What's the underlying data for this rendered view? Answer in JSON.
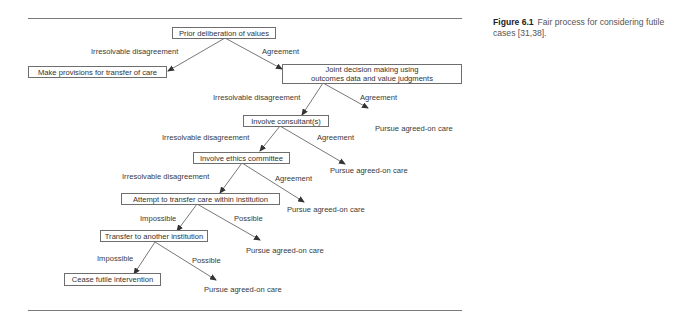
{
  "caption": {
    "figure_label": "Figure 6.1",
    "text": "Fair process for considering futile cases [31,38]."
  },
  "nodes": {
    "prior": "Prior deliberation of values",
    "provisions": "Make provisions for transfer of care",
    "joint": "Joint decision making using outcomes data and value judgments",
    "consultant": "Involve consultant(s)",
    "ethics": "Involve ethics committee",
    "attempt": "Attempt to transfer care within institution",
    "transfer": "Transfer to another institution",
    "cease": "Cease futile intervention",
    "pursue1": "Pursue agreed-on care",
    "pursue2": "Pursue agreed-on care",
    "pursue3": "Pursue agreed-on care",
    "pursue4": "Pursue agreed-on care",
    "pursue5": "Pursue agreed-on care"
  },
  "edge_labels": {
    "e1_disagree": "Irresolvable disagreement",
    "e1_agree": "Agreement",
    "e2_disagree": "Irresolvable disagreement",
    "e2_agree": "Agreement",
    "e3_disagree": "Irresolvable disagreement",
    "e3_agree": "Agreement",
    "e4_disagree": "Irresolvable disagreement",
    "e4_agree": "Agreement",
    "e5_impossible": "Impossible",
    "e5_possible": "Possible",
    "e6_impossible": "Impossible",
    "e6_possible": "Possible"
  },
  "colors": {
    "line": "#555555",
    "box_border": "#6e6e6e",
    "rule": "#7a7a7a"
  }
}
